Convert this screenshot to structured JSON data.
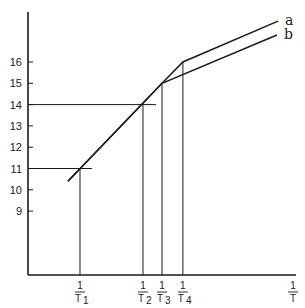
{
  "chart_data": {
    "type": "line",
    "title": "",
    "xlabel": {
      "numerator": "1",
      "denominator": "T"
    },
    "ylabel": "",
    "ylim": [
      7.6,
      18.4
    ],
    "xlim": [
      0,
      1
    ],
    "grid": false,
    "y_ticks": [
      9,
      10,
      11,
      12,
      13,
      14,
      15,
      16
    ],
    "x_ticks": [
      {
        "x": 0.194,
        "numerator": "1",
        "denominator": "T",
        "subscript": "1"
      },
      {
        "x": 0.429,
        "numerator": "1",
        "denominator": "T",
        "subscript": "2"
      },
      {
        "x": 0.5,
        "numerator": "1",
        "denominator": "T",
        "subscript": "3"
      },
      {
        "x": 0.578,
        "numerator": "1",
        "denominator": "T",
        "subscript": "4"
      }
    ],
    "series": [
      {
        "name": "a",
        "x": [
          0.149,
          0.5,
          0.578,
          0.933
        ],
        "y": [
          10.4,
          15.0,
          16.0,
          17.92
        ]
      },
      {
        "name": "b",
        "x": [
          0.149,
          0.5,
          0.929
        ],
        "y": [
          10.4,
          15.0,
          17.27
        ]
      }
    ],
    "reference_lines": [
      {
        "type": "horizontal",
        "y": 11,
        "x_from": 0,
        "x_to": 0.239
      },
      {
        "type": "horizontal",
        "y": 14,
        "x_from": 0,
        "x_to": 0.478
      },
      {
        "type": "vertical",
        "x": 0.194,
        "y_from": 11
      },
      {
        "type": "vertical",
        "x": 0.429,
        "y_from": 14
      },
      {
        "type": "vertical",
        "x": 0.5,
        "y_from": 15
      },
      {
        "type": "vertical",
        "x": 0.578,
        "y_from": 16
      }
    ],
    "legend": "inline labels at line ends (top-right)"
  }
}
